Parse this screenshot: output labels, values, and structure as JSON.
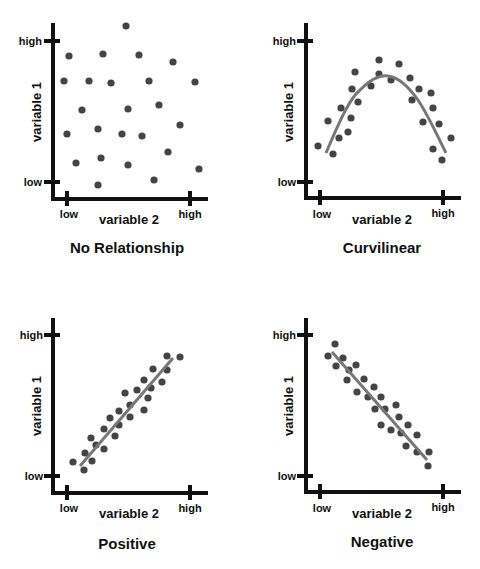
{
  "chart_data": [
    {
      "type": "scatter",
      "title": "No Relationship",
      "xlabel": "variable 2",
      "ylabel": "variable 1",
      "x_ticks": [
        "low",
        "high"
      ],
      "y_ticks": [
        "low",
        "high"
      ],
      "grid": false,
      "trend": "none",
      "points_px": [
        [
          126,
          26
        ],
        [
          69,
          56
        ],
        [
          103,
          54
        ],
        [
          139,
          55
        ],
        [
          173,
          62
        ],
        [
          64,
          81
        ],
        [
          89,
          81
        ],
        [
          111,
          83
        ],
        [
          149,
          81
        ],
        [
          195,
          82
        ],
        [
          82,
          110
        ],
        [
          128,
          109
        ],
        [
          159,
          105
        ],
        [
          67,
          134
        ],
        [
          98,
          129
        ],
        [
          122,
          134
        ],
        [
          142,
          136
        ],
        [
          180,
          125
        ],
        [
          76,
          163
        ],
        [
          101,
          158
        ],
        [
          128,
          165
        ],
        [
          168,
          152
        ],
        [
          199,
          169
        ],
        [
          98,
          185
        ],
        [
          154,
          180
        ]
      ]
    },
    {
      "type": "scatter",
      "title": "Curvilinear",
      "xlabel": "variable 2",
      "ylabel": "variable 1",
      "x_ticks": [
        "low",
        "high"
      ],
      "y_ticks": [
        "low",
        "high"
      ],
      "grid": false,
      "trend": "inverted-U curve",
      "points_px": [
        [
          379,
          60
        ],
        [
          399,
          64
        ],
        [
          355,
          72
        ],
        [
          379,
          74
        ],
        [
          391,
          80
        ],
        [
          410,
          78
        ],
        [
          352,
          89
        ],
        [
          371,
          86
        ],
        [
          419,
          89
        ],
        [
          431,
          93
        ],
        [
          358,
          102
        ],
        [
          412,
          100
        ],
        [
          341,
          108
        ],
        [
          433,
          108
        ],
        [
          328,
          121
        ],
        [
          351,
          118
        ],
        [
          423,
          122
        ],
        [
          439,
          124
        ],
        [
          348,
          132
        ],
        [
          339,
          138
        ],
        [
          451,
          138
        ],
        [
          318,
          146
        ],
        [
          333,
          154
        ],
        [
          433,
          149
        ],
        [
          442,
          160
        ]
      ]
    },
    {
      "type": "scatter",
      "title": "Positive",
      "xlabel": "variable 2",
      "ylabel": "variable 1",
      "x_ticks": [
        "low",
        "high"
      ],
      "y_ticks": [
        "low",
        "high"
      ],
      "grid": false,
      "trend": "positive linear",
      "points_px": [
        [
          167,
          356
        ],
        [
          180,
          357
        ],
        [
          153,
          369
        ],
        [
          167,
          370
        ],
        [
          144,
          380
        ],
        [
          162,
          382
        ],
        [
          125,
          393
        ],
        [
          137,
          390
        ],
        [
          151,
          388
        ],
        [
          148,
          398
        ],
        [
          130,
          405
        ],
        [
          119,
          411
        ],
        [
          144,
          410
        ],
        [
          110,
          418
        ],
        [
          130,
          417
        ],
        [
          119,
          425
        ],
        [
          104,
          429
        ],
        [
          91,
          438
        ],
        [
          115,
          436
        ],
        [
          96,
          445
        ],
        [
          104,
          449
        ],
        [
          85,
          453
        ],
        [
          73,
          462
        ],
        [
          92,
          461
        ],
        [
          84,
          470
        ]
      ]
    },
    {
      "type": "scatter",
      "title": "Negative",
      "xlabel": "variable 2",
      "ylabel": "variable 1",
      "x_ticks": [
        "low",
        "high"
      ],
      "y_ticks": [
        "low",
        "high"
      ],
      "grid": false,
      "trend": "negative linear",
      "points_px": [
        [
          335,
          344
        ],
        [
          328,
          356
        ],
        [
          343,
          358
        ],
        [
          336,
          366
        ],
        [
          349,
          370
        ],
        [
          356,
          365
        ],
        [
          347,
          380
        ],
        [
          364,
          379
        ],
        [
          374,
          387
        ],
        [
          357,
          392
        ],
        [
          368,
          397
        ],
        [
          381,
          397
        ],
        [
          375,
          409
        ],
        [
          385,
          409
        ],
        [
          396,
          405
        ],
        [
          399,
          417
        ],
        [
          381,
          425
        ],
        [
          408,
          425
        ],
        [
          391,
          430
        ],
        [
          401,
          433
        ],
        [
          417,
          435
        ],
        [
          406,
          446
        ],
        [
          417,
          452
        ],
        [
          429,
          452
        ],
        [
          428,
          466
        ]
      ]
    }
  ],
  "panels": [
    {
      "title": "No Relationship",
      "xlabel": "variable 2",
      "ylabel": "variable 1",
      "x_low": "low",
      "x_high": "high",
      "y_low": "low",
      "y_high": "high"
    },
    {
      "title": "Curvilinear",
      "xlabel": "variable 2",
      "ylabel": "variable 1",
      "x_low": "low",
      "x_high": "high",
      "y_low": "low",
      "y_high": "high"
    },
    {
      "title": "Positive",
      "xlabel": "variable 2",
      "ylabel": "variable 1",
      "x_low": "low",
      "x_high": "high",
      "y_low": "low",
      "y_high": "high"
    },
    {
      "title": "Negative",
      "xlabel": "variable 2",
      "ylabel": "variable 1",
      "x_low": "low",
      "x_high": "high",
      "y_low": "low",
      "y_high": "high"
    }
  ],
  "colors": {
    "dot": "#444444",
    "trend": "#777777",
    "axis": "#111111"
  }
}
